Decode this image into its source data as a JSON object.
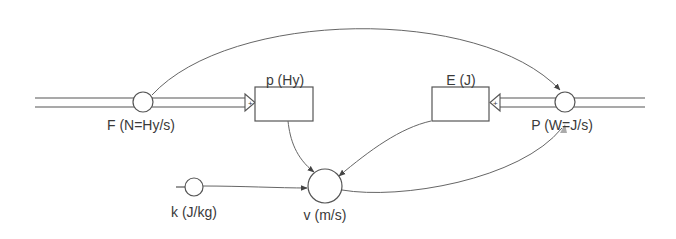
{
  "diagram": {
    "type": "stock-and-flow",
    "colors": {
      "line": "#555555",
      "arrowhead": "#444444",
      "text": "#3a3a3a",
      "background": "#ffffff"
    },
    "stocks": [
      {
        "id": "p",
        "label": "p (Hy)"
      },
      {
        "id": "E",
        "label": "E (J)"
      }
    ],
    "flows": [
      {
        "id": "F",
        "label": "F (N=Hy/s)",
        "into": "p",
        "sign": "+"
      },
      {
        "id": "P",
        "label": "P (W=J/s)",
        "into": "E",
        "sign": "+"
      }
    ],
    "converters": [
      {
        "id": "k",
        "label": "k (J/kg)"
      },
      {
        "id": "v",
        "label": "v (m/s)"
      }
    ],
    "connectors": [
      {
        "from": "F",
        "to": "P"
      },
      {
        "from": "p",
        "to": "v"
      },
      {
        "from": "E",
        "to": "v"
      },
      {
        "from": "k",
        "to": "v"
      },
      {
        "from": "v",
        "to": "P"
      }
    ]
  }
}
